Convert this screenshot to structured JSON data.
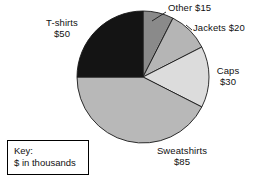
{
  "chart_data": {
    "type": "pie",
    "title": "",
    "unit_note": "$ in thousands",
    "total": 200,
    "categories": [
      "Other",
      "Jackets",
      "Caps",
      "Sweatshirts",
      "T-shirts"
    ],
    "values": [
      15,
      20,
      30,
      85,
      50
    ],
    "slices": [
      {
        "name": "Other",
        "label": "Other $15",
        "value": 15,
        "value_label": "$15",
        "degrees": 27,
        "start_deg": 0,
        "color": "#8a8a8a"
      },
      {
        "name": "Jackets",
        "label": "Jackets $20",
        "value": 20,
        "value_label": "$20",
        "degrees": 36,
        "start_deg": 27,
        "color": "#b5b5b5"
      },
      {
        "name": "Caps",
        "label": "Caps",
        "value": 30,
        "value_label": "$30",
        "degrees": 54,
        "start_deg": 63,
        "color": "#dcdcdc"
      },
      {
        "name": "Sweatshirts",
        "label": "Sweatshirts",
        "value": 85,
        "value_label": "$85",
        "degrees": 153,
        "start_deg": 117,
        "color": "#b8b8b8"
      },
      {
        "name": "T-shirts",
        "label": "T-shirts",
        "value": 50,
        "value_label": "$50",
        "degrees": 90,
        "start_deg": 270,
        "color": "#141414"
      }
    ],
    "legend_position": "none",
    "grid": false
  },
  "labels": {
    "tshirts_name": "T-shirts",
    "tshirts_value": "$50",
    "other": "Other $15",
    "jackets": "Jackets $20",
    "caps_name": "Caps",
    "caps_value": "$30",
    "sweatshirts_name": "Sweatshirts",
    "sweatshirts_value": "$85"
  },
  "key": {
    "title": "Key:",
    "note": "$ in thousands",
    "border_color": "#000000"
  }
}
